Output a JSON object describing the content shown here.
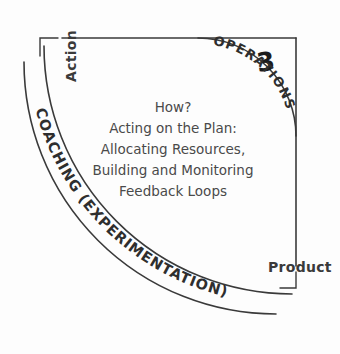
{
  "diagram": {
    "title_number": "3",
    "axes": {
      "vertical_label": "Action",
      "horizontal_label": "Product"
    },
    "inner_arc_label": "OPERATIONS",
    "outer_arc_label": "COACHING (EXPERIMENTATION)",
    "center_text": {
      "line1": "How?",
      "line2": "Acting on the Plan:",
      "line3": "Allocating Resources,",
      "line4": "Building and Monitoring",
      "line5": "Feedback Loops"
    },
    "colors": {
      "ink": "#3a3a3a",
      "text": "#4a4a4a",
      "heading": "#1c1c1c",
      "background": "#fdfdfd"
    }
  }
}
